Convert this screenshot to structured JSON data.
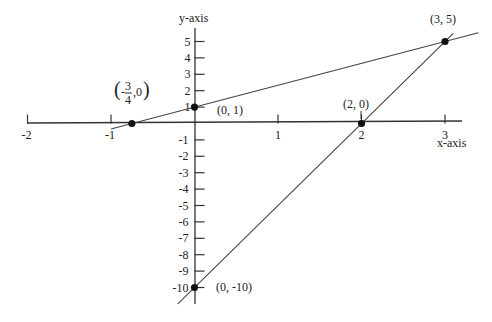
{
  "chart_data": {
    "type": "line",
    "title": "",
    "xlabel": "x-axis",
    "ylabel": "y-axis",
    "xlim": [
      -2,
      3.3
    ],
    "ylim": [
      -11,
      5.5
    ],
    "grid": false,
    "x_ticks": [
      -2,
      -1,
      1,
      2,
      3
    ],
    "y_ticks": [
      5,
      4,
      3,
      2,
      1,
      -1,
      -2,
      -3,
      -4,
      -5,
      -6,
      -7,
      -8,
      -9,
      -10
    ],
    "series": [
      {
        "name": "line-1",
        "equation": "y = (4/3)x + 1",
        "x": [
          -1.0,
          3.4
        ],
        "y": [
          -0.333,
          5.533
        ]
      },
      {
        "name": "line-2",
        "equation": "y = 5x - 10",
        "x": [
          -0.2,
          3.1
        ],
        "y": [
          -11,
          5.5
        ]
      }
    ],
    "points": [
      {
        "x": -0.75,
        "y": 0,
        "label": "(-3/4, 0)"
      },
      {
        "x": 0,
        "y": 1,
        "label": "(0, 1)"
      },
      {
        "x": 2,
        "y": 0,
        "label": "(2, 0)"
      },
      {
        "x": 3,
        "y": 5,
        "label": "(3, 5)"
      },
      {
        "x": 0,
        "y": -10,
        "label": "(0, -10)"
      }
    ]
  },
  "labels": {
    "x_axis": "x-axis",
    "y_axis": "y-axis",
    "pt_neg34": {
      "num": "3",
      "den": "4",
      "minus": "-",
      "rest": ",0"
    },
    "pt_0_1": "(0, 1)",
    "pt_2_0": "(2, 0)",
    "pt_3_5": "(3, 5)",
    "pt_0_neg10": "(0, -10)"
  },
  "colors": {
    "line": "#333333",
    "axis": "#333333",
    "point": "#111111"
  }
}
